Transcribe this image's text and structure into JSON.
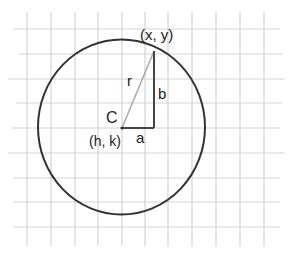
{
  "diagram": {
    "type": "circle-on-grid",
    "labels": {
      "point": "(x, y)",
      "center_letter": "C",
      "center_coords": "(h, k)",
      "radius": "r",
      "horizontal_leg": "a",
      "vertical_leg": "b"
    },
    "colors": {
      "grid": "#d4d4d4",
      "circle": "#333333",
      "radius_line": "#a8a8a8",
      "legs": "#444444",
      "text": "#222222"
    }
  }
}
